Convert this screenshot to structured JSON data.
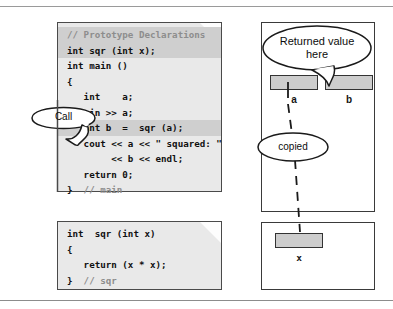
{
  "figure": {
    "title_rules": {
      "top": "",
      "bottom": ""
    }
  },
  "main_code": {
    "lines": [
      {
        "text": "// Prototype Declarations",
        "comment": true,
        "highlight": true
      },
      {
        "text": "int sqr (int x);",
        "comment": false,
        "highlight": true
      },
      {
        "text": "int main ()",
        "comment": false,
        "highlight": false
      },
      {
        "text": "{",
        "comment": false,
        "highlight": false
      },
      {
        "text": "   int    a;",
        "comment": false,
        "highlight": false
      },
      {
        "text": "   cin >> a;",
        "comment": false,
        "highlight": false
      },
      {
        "text": "   int b  =  sqr (a);",
        "comment": false,
        "highlight": true
      },
      {
        "text": "   cout << a << \" squared: \"",
        "comment": false,
        "highlight": false
      },
      {
        "text": "        << b << endl;",
        "comment": false,
        "highlight": false
      },
      {
        "text": "   return 0;",
        "comment": false,
        "highlight": false
      },
      {
        "text": "}  // main",
        "comment": false,
        "highlight": false,
        "trailing_comment": "// main"
      }
    ]
  },
  "sqr_code": {
    "lines": [
      {
        "text": "int  sqr (int x)",
        "comment": false,
        "highlight": false
      },
      {
        "text": "{",
        "comment": false,
        "highlight": false
      },
      {
        "text": "   return (x * x);",
        "comment": false,
        "highlight": false
      },
      {
        "text": "}  // sqr",
        "comment": false,
        "highlight": false,
        "trailing_comment": "// sqr"
      }
    ]
  },
  "callouts": {
    "call": "Call",
    "returned_value": "Returned value\nhere",
    "returned_value_line1": "Returned value",
    "returned_value_line2": "here",
    "copied": "copied"
  },
  "memory": {
    "main_frame_label": "",
    "variables": [
      {
        "name": "a"
      },
      {
        "name": "b"
      }
    ],
    "sqr_frame_label": "",
    "sqr_variables": [
      {
        "name": "x"
      }
    ]
  },
  "colors": {
    "code_background": "#e9e9e9",
    "code_border": "#4a4a4a",
    "highlight": "#cfcfcf",
    "comment_text": "#8d8d8d",
    "code_text": "#101010",
    "var_fill": "#cdcdcd",
    "var_border": "#333333",
    "frame_border": "#3a3a3a",
    "rule": "#9a9a9a",
    "page": "#ffffff"
  }
}
